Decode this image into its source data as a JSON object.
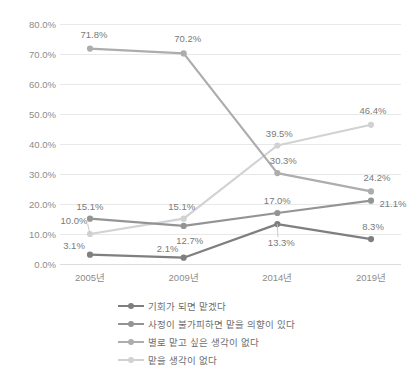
{
  "chart_data": {
    "type": "line",
    "title": "",
    "xlabel": "",
    "ylabel": "",
    "categories": [
      "2005년",
      "2009년",
      "2014년",
      "2019년"
    ],
    "ylim": [
      0,
      80
    ],
    "ytick_labels": [
      "0.0%",
      "10.0%",
      "20.0%",
      "30.0%",
      "40.0%",
      "50.0%",
      "60.0%",
      "70.0%",
      "80.0%"
    ],
    "ytick_values": [
      0,
      10,
      20,
      30,
      40,
      50,
      60,
      70,
      80
    ],
    "grid": true,
    "legend_position": "bottom",
    "series": [
      {
        "name": "기회가 되면 맡겠다",
        "color": "#7f7f7f",
        "values": [
          3.1,
          2.1,
          13.3,
          8.3
        ],
        "labels": [
          "3.1%",
          "2.1%",
          "13.3%",
          "8.3%"
        ]
      },
      {
        "name": "사정이 불가피하면 맡을 의향이 있다",
        "color": "#949494",
        "values": [
          15.1,
          12.7,
          17.0,
          21.1
        ],
        "labels": [
          "15.1%",
          "12.7%",
          "17.0%",
          "21.1%"
        ]
      },
      {
        "name": "별로 맡고 싶은 생각이 없다",
        "color": "#adadad",
        "values": [
          71.8,
          70.2,
          30.3,
          24.2
        ],
        "labels": [
          "71.8%",
          "70.2%",
          "30.3%",
          "24.2%"
        ]
      },
      {
        "name": "맡을 생각이 없다",
        "color": "#d2d2d2",
        "values": [
          10.0,
          15.1,
          39.5,
          46.4
        ],
        "labels": [
          "10.0%",
          "15.1%",
          "39.5%",
          "46.4%"
        ]
      }
    ]
  },
  "legend": {
    "items": [
      {
        "label": "기회가 되면 맡겠다"
      },
      {
        "label": "사정이 불가피하면 맡을 의향이 있다"
      },
      {
        "label": "별로 맡고 싶은 생각이 없다"
      },
      {
        "label": "맡을 생각이 없다"
      }
    ]
  }
}
